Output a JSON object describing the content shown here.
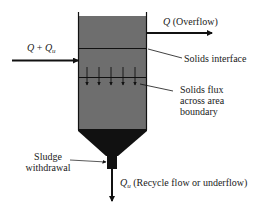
{
  "diagram": {
    "type": "clarifier-schematic",
    "colors": {
      "tank_fill": "#6e6e6e",
      "sludge_fill": "#111111",
      "line": "#111111",
      "background": "#ffffff"
    },
    "labels": {
      "inflow": {
        "main": "Q",
        "plus": " + ",
        "sym": "Q",
        "sub": "u"
      },
      "overflow": {
        "sym": "Q",
        "text": " (Overflow)"
      },
      "solids_interface": "Solids interface",
      "solids_flux": [
        "Solids flux",
        "across area",
        "boundary"
      ],
      "sludge_withdrawal": [
        "Sludge",
        "withdrawal"
      ],
      "underflow": {
        "sym": "Q",
        "sub": "u",
        "text": " (Recycle flow or underflow)"
      }
    },
    "flux_arrow_count": 5
  }
}
